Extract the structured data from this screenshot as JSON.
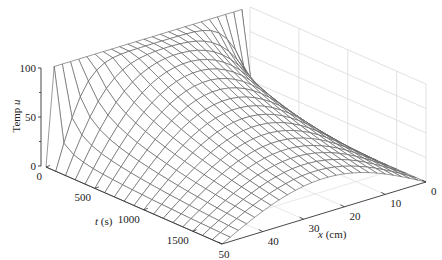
{
  "chart_data": {
    "type": "surface",
    "title": "",
    "xlabel": "x (cm)",
    "ylabel": "t (s)",
    "zlabel": "Temp u",
    "x_range": [
      0,
      50
    ],
    "t_range": [
      0,
      1800
    ],
    "z_range": [
      0,
      100
    ],
    "x_ticks": [
      0,
      10,
      20,
      30,
      40,
      50
    ],
    "t_ticks": [
      0,
      500,
      1000,
      1500
    ],
    "z_ticks": [
      0,
      50,
      100
    ],
    "grid": true,
    "mesh_resolution": {
      "x_lines": 26,
      "t_lines": 19
    },
    "surface_samples": {
      "x": [
        0,
        10,
        20,
        25,
        30,
        40,
        50
      ],
      "t": [
        0,
        500,
        1000,
        1500,
        1800
      ],
      "u": [
        [
          0,
          100,
          100,
          100,
          100,
          100,
          0
        ],
        [
          0,
          62,
          88,
          91,
          88,
          62,
          0
        ],
        [
          0,
          42,
          67,
          71,
          67,
          42,
          0
        ],
        [
          0,
          28,
          46,
          48,
          46,
          28,
          0
        ],
        [
          0,
          22,
          36,
          38,
          36,
          22,
          0
        ]
      ]
    },
    "model": {
      "boundary_left": 0,
      "boundary_right": 0,
      "initial": 100,
      "length_cm": 50,
      "diffusivity": 0.18
    }
  },
  "labels": {
    "zlabel_text": "Temp ",
    "zlabel_var": "u",
    "ylabel_var": "t",
    "ylabel_unit": " (s)",
    "xlabel_var": "x",
    "xlabel_unit": " (cm)"
  },
  "colors": {
    "mesh": "#555555",
    "axis": "#333333",
    "grid": "#d9d9d9",
    "background": "#ffffff"
  }
}
